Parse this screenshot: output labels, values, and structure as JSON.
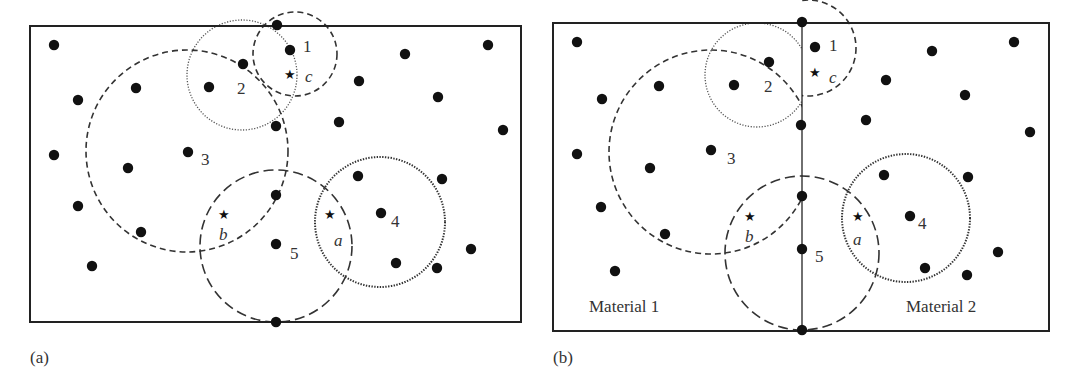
{
  "panels": [
    {
      "id": "a",
      "caption": "(a)",
      "frame": {
        "x": 30,
        "y": 26,
        "w": 491,
        "h": 296
      },
      "divider": null,
      "dots": [
        [
          54,
          45
        ],
        [
          277,
          25
        ],
        [
          290,
          50
        ],
        [
          405,
          54
        ],
        [
          488,
          45
        ],
        [
          243,
          64
        ],
        [
          136,
          88
        ],
        [
          209,
          87
        ],
        [
          78,
          100
        ],
        [
          359,
          81
        ],
        [
          438,
          97
        ],
        [
          276,
          126
        ],
        [
          339,
          122
        ],
        [
          503,
          130
        ],
        [
          54,
          155
        ],
        [
          188,
          152
        ],
        [
          128,
          168
        ],
        [
          358,
          176
        ],
        [
          442,
          179
        ],
        [
          276,
          195
        ],
        [
          78,
          206
        ],
        [
          381,
          213
        ],
        [
          141,
          232
        ],
        [
          276,
          244
        ],
        [
          471,
          249
        ],
        [
          396,
          263
        ],
        [
          437,
          268
        ],
        [
          92,
          266
        ],
        [
          276,
          322
        ]
      ],
      "circles": [
        {
          "label": "1",
          "cx": 295,
          "cy": 54,
          "r": 42,
          "style": "dash"
        },
        {
          "label": "2",
          "cx": 242,
          "cy": 75,
          "r": 55,
          "style": "dot"
        },
        {
          "label": "3",
          "cx": 187,
          "cy": 151,
          "r": 101,
          "style": "dash"
        },
        {
          "label": "5",
          "cx": 276,
          "cy": 246,
          "r": 76,
          "style": "long"
        },
        {
          "label": "4",
          "cx": 380,
          "cy": 222,
          "r": 65,
          "style": "dotheavy"
        }
      ],
      "stars": [
        {
          "name": "c",
          "x": 290,
          "y": 74
        },
        {
          "name": "b",
          "x": 224,
          "y": 214
        },
        {
          "name": "a",
          "x": 330,
          "y": 214
        }
      ],
      "labels": [
        {
          "text": "1",
          "x": 303,
          "y": 52,
          "italic": false
        },
        {
          "text": "2",
          "x": 237,
          "y": 94,
          "italic": false
        },
        {
          "text": "3",
          "x": 201,
          "y": 165,
          "italic": false
        },
        {
          "text": "4",
          "x": 391,
          "y": 227,
          "italic": false
        },
        {
          "text": "5",
          "x": 290,
          "y": 259,
          "italic": false
        },
        {
          "text": "c",
          "x": 305,
          "y": 82,
          "italic": true
        },
        {
          "text": "b",
          "x": 219,
          "y": 240,
          "italic": true
        },
        {
          "text": "a",
          "x": 334,
          "y": 246,
          "italic": true
        }
      ],
      "materials": []
    },
    {
      "id": "b",
      "caption": "(b)",
      "frame": {
        "x": 553,
        "y": 23,
        "w": 496,
        "h": 308
      },
      "divider": {
        "x": 802,
        "y1": 23,
        "y2": 331
      },
      "dots": [
        [
          577,
          42
        ],
        [
          802,
          22
        ],
        [
          815,
          47
        ],
        [
          932,
          51
        ],
        [
          1014,
          42
        ],
        [
          769,
          62
        ],
        [
          659,
          86
        ],
        [
          734,
          85
        ],
        [
          602,
          99
        ],
        [
          886,
          80
        ],
        [
          965,
          95
        ],
        [
          801,
          125
        ],
        [
          866,
          120
        ],
        [
          1030,
          132
        ],
        [
          577,
          154
        ],
        [
          711,
          150
        ],
        [
          650,
          168
        ],
        [
          884,
          175
        ],
        [
          968,
          177
        ],
        [
          802,
          196
        ],
        [
          601,
          207
        ],
        [
          910,
          216
        ],
        [
          665,
          234
        ],
        [
          802,
          249
        ],
        [
          998,
          252
        ],
        [
          615,
          271
        ],
        [
          925,
          268
        ],
        [
          967,
          275
        ],
        [
          802,
          330
        ]
      ],
      "circles": [
        {
          "label": "1",
          "cx": 808,
          "cy": 48,
          "r": 48,
          "style": "dash",
          "clip": "right"
        },
        {
          "label": "2",
          "cx": 757,
          "cy": 75,
          "r": 52,
          "style": "dot",
          "clip": "left"
        },
        {
          "label": "3",
          "cx": 711,
          "cy": 152,
          "r": 102,
          "style": "dash",
          "clip": "left"
        },
        {
          "label": "5",
          "cx": 802,
          "cy": 253,
          "r": 77,
          "style": "long"
        },
        {
          "label": "4",
          "cx": 906,
          "cy": 218,
          "r": 64,
          "style": "dotheavy"
        }
      ],
      "stars": [
        {
          "name": "c",
          "x": 815,
          "y": 72
        },
        {
          "name": "b",
          "x": 750,
          "y": 216
        },
        {
          "name": "a",
          "x": 858,
          "y": 216
        }
      ],
      "labels": [
        {
          "text": "1",
          "x": 829,
          "y": 51,
          "italic": false
        },
        {
          "text": "2",
          "x": 764,
          "y": 92,
          "italic": false
        },
        {
          "text": "3",
          "x": 727,
          "y": 164,
          "italic": false
        },
        {
          "text": "4",
          "x": 918,
          "y": 229,
          "italic": false
        },
        {
          "text": "5",
          "x": 815,
          "y": 262,
          "italic": false
        },
        {
          "text": "c",
          "x": 829,
          "y": 83,
          "italic": true
        },
        {
          "text": "b",
          "x": 745,
          "y": 242,
          "italic": true
        },
        {
          "text": "a",
          "x": 853,
          "y": 245,
          "italic": true
        }
      ],
      "materials": [
        {
          "text": "Material 1",
          "x": 589,
          "y": 312
        },
        {
          "text": "Material 2",
          "x": 906,
          "y": 312
        }
      ]
    }
  ]
}
